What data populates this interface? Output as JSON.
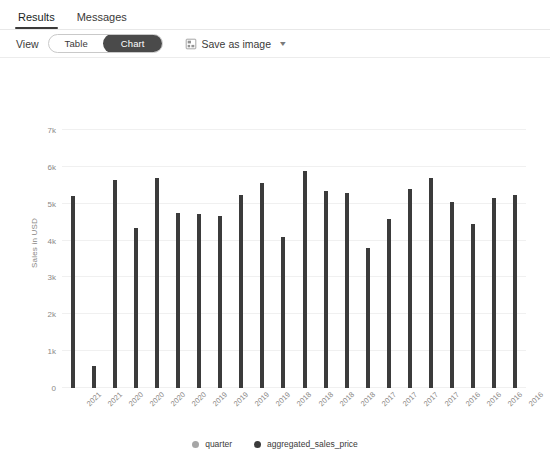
{
  "tabs": [
    {
      "label": "Results",
      "active": true
    },
    {
      "label": "Messages",
      "active": false
    }
  ],
  "toolbar": {
    "view_label": "View",
    "toggle": {
      "table_label": "Table",
      "chart_label": "Chart",
      "selected": "Chart"
    },
    "save_as_image_label": "Save as image",
    "save_icon": "save-image-icon",
    "chevron_icon": "chevron-down-icon"
  },
  "legend": [
    {
      "label": "quarter",
      "color": "#a6a6a6",
      "icon": "legend-dot-icon"
    },
    {
      "label": "aggregated_sales_price",
      "color": "#3b3b3b",
      "icon": "legend-dot-icon"
    }
  ],
  "chart_data": {
    "type": "bar",
    "title": "",
    "xlabel": "",
    "ylabel": "Sales in USD",
    "ylim": [
      0,
      7000
    ],
    "yticks": [
      0,
      1000,
      2000,
      3000,
      4000,
      5000,
      6000,
      7000
    ],
    "ytick_labels": [
      "0",
      "1k",
      "2k",
      "3k",
      "4k",
      "5k",
      "6k",
      "7k"
    ],
    "grid": true,
    "legend_position": "bottom",
    "bar_color": "#3b3b3b",
    "categories": [
      "2021",
      "2021",
      "2020",
      "2020",
      "2020",
      "2020",
      "2019",
      "2019",
      "2019",
      "2019",
      "2018",
      "2018",
      "2018",
      "2018",
      "2017",
      "2017",
      "2017",
      "2017",
      "2016",
      "2016",
      "2016",
      "2016"
    ],
    "series": [
      {
        "name": "aggregated_sales_price",
        "values": [
          5200,
          600,
          5650,
          4330,
          5700,
          4760,
          4720,
          4680,
          5240,
          5550,
          4100,
          5900,
          5350,
          5300,
          3800,
          4580,
          5400,
          5700,
          5040,
          4450,
          5150,
          5250
        ]
      }
    ]
  }
}
